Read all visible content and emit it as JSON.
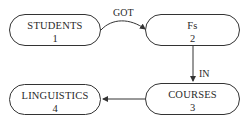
{
  "diagram": {
    "nodes": [
      {
        "id": 1,
        "name": "STUDENTS",
        "number": "1"
      },
      {
        "id": 2,
        "name": "Fs",
        "number": "2"
      },
      {
        "id": 3,
        "name": "COURSES",
        "number": "3"
      },
      {
        "id": 4,
        "name": "LINGUISTICS",
        "number": "4"
      }
    ],
    "edges": [
      {
        "from": 1,
        "to": 2,
        "label": "GOT"
      },
      {
        "from": 2,
        "to": 3,
        "label": "IN"
      },
      {
        "from": 3,
        "to": 4,
        "label": ""
      }
    ]
  }
}
